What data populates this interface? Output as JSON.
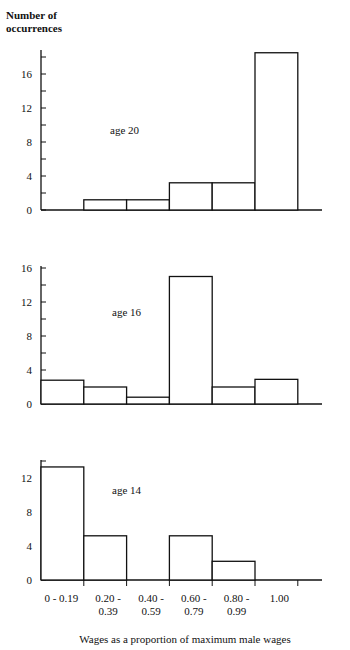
{
  "chart_data": [
    {
      "type": "bar",
      "title": "age 20",
      "ylabel": "Number of occurrences",
      "xlabel": "Wages as a proportion of maximum male wages",
      "categories": [
        "0-0.19",
        "0.20-0.39",
        "0.40-0.59",
        "0.60-0.79",
        "0.80-0.99",
        "1.00"
      ],
      "values": [
        0,
        1.2,
        1.2,
        3.2,
        3.2,
        18.5
      ],
      "yticks": [
        0,
        4,
        8,
        12,
        16
      ],
      "ylim": [
        0,
        19
      ],
      "grid": false
    },
    {
      "type": "bar",
      "title": "age 16",
      "ylabel": "Number of occurrences",
      "xlabel": "Wages as a proportion of maximum male wages",
      "categories": [
        "0-0.19",
        "0.20-0.39",
        "0.40-0.59",
        "0.60-0.79",
        "0.80-0.99",
        "1.00"
      ],
      "values": [
        2.8,
        2,
        0.8,
        15,
        2,
        2.9
      ],
      "yticks": [
        0,
        4,
        8,
        12,
        16
      ],
      "ylim": [
        0,
        16
      ],
      "grid": false
    },
    {
      "type": "bar",
      "title": "age 14",
      "ylabel": "Number of occurrences",
      "xlabel": "Wages as a proportion of maximum male wages",
      "categories": [
        "0-0.19",
        "0.20-0.39",
        "0.40-0.59",
        "0.60-0.79",
        "0.80-0.99",
        "1.00"
      ],
      "values": [
        13.3,
        5.2,
        0,
        5.2,
        2.2,
        0
      ],
      "yticks": [
        0,
        4,
        8,
        12
      ],
      "ylim": [
        0,
        14
      ],
      "grid": false
    }
  ],
  "labels": {
    "ylabel_line1": "Number of",
    "ylabel_line2": "occurrences",
    "xlabel": "Wages as a proportion of maximum male wages",
    "x_tick_labels": [
      {
        "line1": "0 - 0.19",
        "line2": ""
      },
      {
        "line1": "0.20 -",
        "line2": "0.39"
      },
      {
        "line1": "0.40 -",
        "line2": "0.59"
      },
      {
        "line1": "0.60 -",
        "line2": "0.79"
      },
      {
        "line1": "0.80 -",
        "line2": "0.99"
      },
      {
        "line1": "1.00",
        "line2": ""
      }
    ]
  },
  "layout": {
    "axis_x": 41,
    "bin_width": 42.8,
    "axis_end_x": 322,
    "px_per_unit": 8.5,
    "panels": [
      {
        "zero_y": 210,
        "top_y": 50,
        "label_x": 110,
        "label_y": 134
      },
      {
        "zero_y": 404,
        "top_y": 266,
        "label_x": 112,
        "label_y": 316
      },
      {
        "zero_y": 580,
        "top_y": 460,
        "label_x": 112,
        "label_y": 494
      }
    ]
  }
}
